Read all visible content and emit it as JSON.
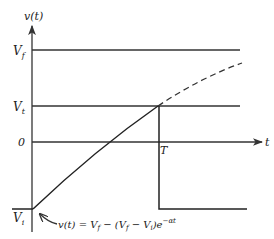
{
  "diagram": {
    "y_axis_label": "v(t)",
    "x_axis_label": "t",
    "levels": {
      "final": {
        "label": "V",
        "subscript": "f"
      },
      "threshold": {
        "label": "V",
        "subscript": "t"
      },
      "zero": {
        "label": "0"
      },
      "initial": {
        "label": "V",
        "subscript": "i"
      }
    },
    "time_marker": "T",
    "formula": {
      "lhs": "v(t) = V",
      "sub1": "f",
      "mid": " − (V",
      "sub2": "f",
      "mid2": " − V",
      "sub3": "i",
      "rhs": ")e",
      "exponent": "−αt"
    },
    "colors": {
      "ink": "#222222",
      "background": "#ffffff"
    }
  }
}
